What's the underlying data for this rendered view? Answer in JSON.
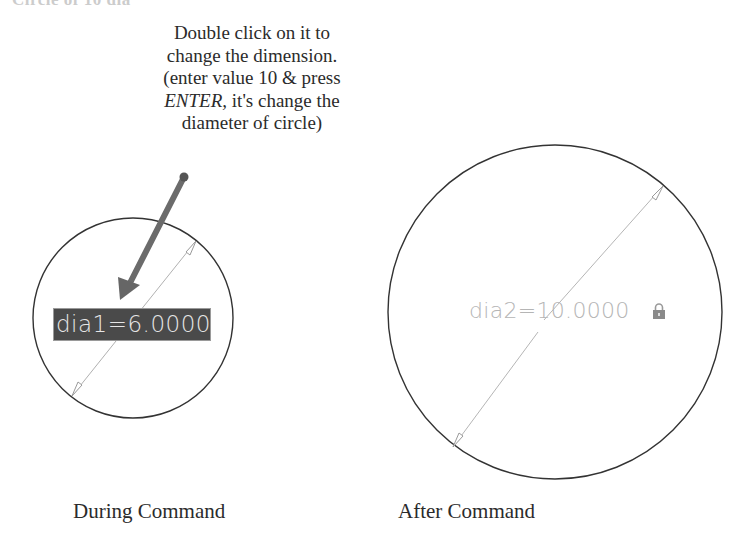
{
  "heading": {
    "text": "Circle of 10 dia"
  },
  "callout": {
    "line1": "Double click on it to",
    "line2": "change the dimension.",
    "line3": "(enter value 10 & press",
    "line4_key": "ENTER,",
    "line4_rest": " it's change the",
    "line5": "diameter of circle)"
  },
  "during": {
    "dimension_value": "dia1=6.0000",
    "caption": "During Command"
  },
  "after": {
    "dimension_value": "dia2=10.0000",
    "lock_icon": "lock-icon",
    "caption": "After Command"
  },
  "colors": {
    "circle_stroke": "#333333",
    "dimension_line": "#b0b0b0",
    "arrow": "#6b6b6b",
    "input_bg": "#4a4a4a",
    "input_text": "#e6e6e6",
    "dim_text": "#b5b5b5"
  }
}
